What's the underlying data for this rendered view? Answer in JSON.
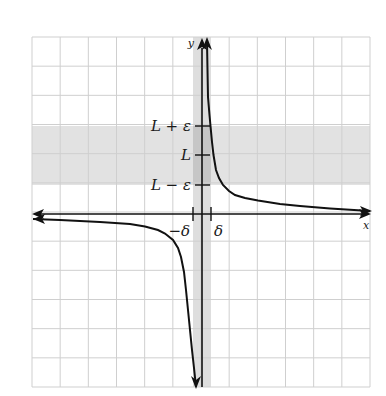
{
  "figure": {
    "colors": {
      "background": "#ffffff",
      "grid": "#cfcfcf",
      "epsilon_band": "#e2e2e2",
      "delta_strip": "#dadada",
      "overlap": "#c6c6c6",
      "axes": "#111111",
      "curve": "#111111"
    },
    "grid": {
      "left": 32,
      "right": 370,
      "top": 37,
      "bottom": 387,
      "columns": 12,
      "rows": 12
    },
    "axes": {
      "x_label": "x",
      "y_label": "y",
      "origin_px": [
        202,
        214
      ]
    },
    "y_ticks": [
      {
        "label": "L + ε",
        "y": 126
      },
      {
        "label": "L",
        "y": 155
      },
      {
        "label": "L − ε",
        "y": 185
      }
    ],
    "x_ticks": [
      {
        "label": "−δ",
        "x": 193
      },
      {
        "label": "δ",
        "x": 211
      }
    ],
    "epsilon_band": {
      "y_top": 126,
      "y_bottom": 185
    },
    "delta_strip": {
      "x_left": 193,
      "x_right": 211
    },
    "curve_branches": {
      "upper_right": [
        [
          207,
          42
        ],
        [
          207.5,
          70
        ],
        [
          208,
          97
        ],
        [
          209.5,
          115
        ],
        [
          210.5,
          126
        ],
        [
          212,
          142
        ],
        [
          213.5,
          155
        ],
        [
          216,
          170
        ],
        [
          219,
          178
        ],
        [
          223,
          185
        ],
        [
          229,
          191
        ],
        [
          235,
          195
        ],
        [
          245,
          198
        ],
        [
          258,
          200.5
        ],
        [
          280,
          204
        ],
        [
          300,
          206
        ],
        [
          330,
          208.5
        ],
        [
          370,
          211
        ]
      ],
      "lower_left": [
        [
          33,
          219
        ],
        [
          60,
          220
        ],
        [
          100,
          222
        ],
        [
          130,
          224
        ],
        [
          145,
          226.5
        ],
        [
          158,
          230
        ],
        [
          165,
          233.5
        ],
        [
          173,
          240
        ],
        [
          178,
          248
        ],
        [
          181,
          257
        ],
        [
          184,
          272
        ],
        [
          186,
          290
        ],
        [
          188,
          310
        ],
        [
          190,
          330
        ],
        [
          192,
          350
        ],
        [
          194,
          368
        ],
        [
          196,
          387
        ]
      ]
    }
  }
}
